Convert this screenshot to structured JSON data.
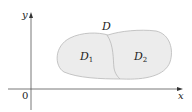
{
  "diagram": {
    "axes": {
      "x_label": "x",
      "y_label": "y",
      "origin_label": "0"
    },
    "region": {
      "label": "D",
      "subregions": [
        {
          "label": "D",
          "subscript": "1"
        },
        {
          "label": "D",
          "subscript": "2"
        }
      ],
      "fill_color": "#ececec",
      "stroke_color": "#b8b8b8"
    },
    "axis_color": "#555555"
  }
}
